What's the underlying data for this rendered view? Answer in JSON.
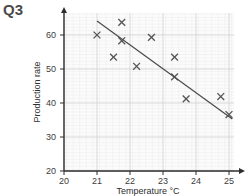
{
  "question_label": "Q3",
  "chart_data": {
    "type": "scatter",
    "title": "",
    "xlabel": "Temperature °C",
    "ylabel": "Production rate",
    "xlim": [
      20,
      25.2
    ],
    "ylim": [
      20,
      65
    ],
    "xticks": [
      20,
      21,
      22,
      23,
      24,
      25
    ],
    "yticks": [
      20,
      30,
      40,
      50,
      60
    ],
    "xtick_labels": [
      "20",
      "21",
      "22",
      "23",
      "24",
      "25"
    ],
    "ytick_labels": [
      "20",
      "30",
      "40",
      "50",
      "60"
    ],
    "grid": true,
    "grid_minor_x_step": 0.1,
    "grid_minor_y_step": 1,
    "legend": "none",
    "marker": "x",
    "marker_color": "#555555",
    "points": [
      {
        "x": 21.0,
        "y": 60.0
      },
      {
        "x": 21.5,
        "y": 53.5
      },
      {
        "x": 21.75,
        "y": 63.7
      },
      {
        "x": 21.75,
        "y": 58.3
      },
      {
        "x": 22.2,
        "y": 50.8
      },
      {
        "x": 22.65,
        "y": 59.3
      },
      {
        "x": 23.35,
        "y": 53.5
      },
      {
        "x": 23.35,
        "y": 47.7
      },
      {
        "x": 23.7,
        "y": 41.2
      },
      {
        "x": 24.75,
        "y": 41.9
      },
      {
        "x": 25.0,
        "y": 36.6
      }
    ],
    "trend_line": {
      "type": "line-of-best-fit",
      "color": "#4a4a4a",
      "x1": 21.0,
      "y1": 64.1,
      "x2": 25.1,
      "y2": 35.3
    }
  }
}
